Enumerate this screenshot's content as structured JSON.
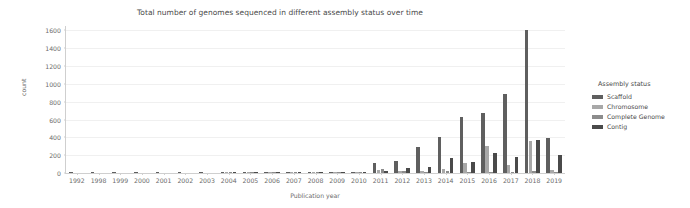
{
  "chart_data": {
    "type": "bar",
    "title": "Total number of genomes sequenced in different assembly status over time",
    "xlabel": "Publication year",
    "ylabel": "count",
    "grid": true,
    "legend_position": "right",
    "legend_title": "Assembly status",
    "ylim": [
      0,
      1650
    ],
    "yticks": [
      0,
      200,
      400,
      600,
      800,
      1000,
      1200,
      1400,
      1600
    ],
    "ytick_labels": [
      "0",
      "200",
      "400",
      "600",
      "800",
      "1000",
      "1200",
      "1400",
      "1600"
    ],
    "categories": [
      "1992",
      "1998",
      "1999",
      "2000",
      "2001",
      "2002",
      "2003",
      "2004",
      "2005",
      "2006",
      "2007",
      "2008",
      "2009",
      "2010",
      "2011",
      "2012",
      "2013",
      "2014",
      "2015",
      "2016",
      "2017",
      "2018",
      "2019"
    ],
    "series": [
      {
        "name": "Scaffold",
        "color": "#5f5f5f",
        "values": [
          1,
          1,
          1,
          1,
          1,
          1,
          2,
          5,
          9,
          8,
          13,
          9,
          8,
          10,
          110,
          135,
          295,
          400,
          625,
          670,
          890,
          1610,
          390
        ]
      },
      {
        "name": "Chromosome",
        "color": "#a8a8a8",
        "values": [
          0,
          0,
          0,
          0,
          0,
          0,
          0,
          2,
          4,
          3,
          5,
          3,
          4,
          5,
          30,
          20,
          18,
          45,
          110,
          300,
          95,
          355,
          35
        ]
      },
      {
        "name": "Complete Genome",
        "color": "#8c8c8c",
        "values": [
          0,
          0,
          0,
          0,
          0,
          0,
          0,
          1,
          2,
          2,
          3,
          2,
          3,
          4,
          45,
          22,
          12,
          20,
          12,
          14,
          14,
          20,
          10
        ]
      },
      {
        "name": "Contig",
        "color": "#4a4a4a",
        "values": [
          0,
          0,
          0,
          0,
          0,
          0,
          0,
          2,
          5,
          4,
          7,
          4,
          5,
          8,
          28,
          55,
          65,
          170,
          125,
          230,
          180,
          375,
          200
        ]
      }
    ]
  }
}
